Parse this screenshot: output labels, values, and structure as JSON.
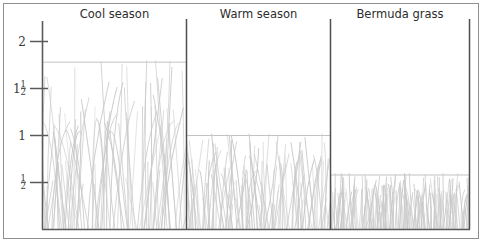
{
  "figure": {
    "kind": "grass-height-comparison-diagram",
    "background_color": "#ffffff",
    "frame_color": "#8f8f8f",
    "axis_color": "#5a5a5a",
    "grass_color": "#c9c9c9",
    "text_color": "#2c2c2c"
  },
  "axis": {
    "ticks": [
      {
        "label": "2",
        "value": 2.0,
        "is_fraction": false,
        "whole": "2",
        "numerator": "",
        "denominator": ""
      },
      {
        "label": "1 1/2",
        "value": 1.5,
        "is_fraction": true,
        "whole": "1",
        "numerator": "1",
        "denominator": "2"
      },
      {
        "label": "1",
        "value": 1.0,
        "is_fraction": false,
        "whole": "1",
        "numerator": "",
        "denominator": ""
      },
      {
        "label": "1/2",
        "value": 0.5,
        "is_fraction": true,
        "whole": "",
        "numerator": "1",
        "denominator": "2"
      }
    ],
    "min": 0,
    "max": 2.25,
    "unit": "inches"
  },
  "chart_data": {
    "type": "bar",
    "title": "",
    "xlabel": "",
    "ylabel": "",
    "ylim": [
      0,
      2.25
    ],
    "grid": false,
    "legend": "none",
    "categories": [
      "Cool season",
      "Warm season",
      "Bermuda grass"
    ],
    "values": [
      1.78,
      1.0,
      0.58
    ],
    "tick_labels": [
      "2",
      "1½",
      "1",
      "½"
    ],
    "tick_values": [
      2,
      1.5,
      1,
      0.5
    ],
    "series": [
      {
        "name": "Recommended mowing height",
        "values": [
          1.78,
          1.0,
          0.58
        ]
      }
    ]
  },
  "panels": [
    {
      "id": "cool-season",
      "title": "Cool season",
      "value": 1.78,
      "blade_density": 54,
      "blade_style": "tall-wavy-crossing"
    },
    {
      "id": "warm-season",
      "title": "Warm season",
      "value": 1.0,
      "blade_density": 72,
      "blade_style": "medium-dense"
    },
    {
      "id": "bermuda-grass",
      "title": "Bermuda grass",
      "value": 0.58,
      "blade_density": 110,
      "blade_style": "short-very-dense"
    }
  ]
}
